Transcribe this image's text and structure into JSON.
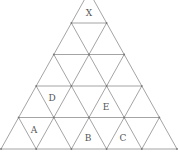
{
  "diagram": {
    "type": "triangular-grid",
    "rows": 5,
    "line_color": "#9a9a9a",
    "label_color": "#555555",
    "geometry": {
      "base_left_x": 1,
      "base_right_x": 177,
      "base_y": 149,
      "row_height": 31.5
    },
    "labels": [
      {
        "id": "X",
        "text": "X",
        "x": 89,
        "y": 16
      },
      {
        "id": "D",
        "text": "D",
        "x": 52,
        "y": 101
      },
      {
        "id": "E",
        "text": "E",
        "x": 106,
        "y": 110
      },
      {
        "id": "A",
        "text": "A",
        "x": 34,
        "y": 133
      },
      {
        "id": "B",
        "text": "B",
        "x": 88,
        "y": 141
      },
      {
        "id": "C",
        "text": "C",
        "x": 123,
        "y": 141
      }
    ]
  }
}
